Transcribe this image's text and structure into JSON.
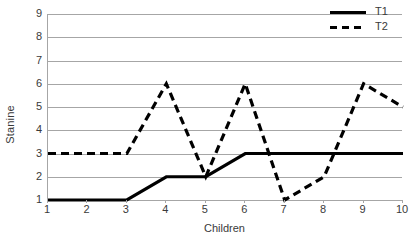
{
  "chart_data": {
    "type": "line",
    "title": "",
    "xlabel": "Children",
    "ylabel": "Stanine",
    "x": [
      1,
      2,
      3,
      4,
      5,
      6,
      7,
      8,
      9,
      10
    ],
    "categories": [
      "1",
      "2",
      "3",
      "4",
      "5",
      "6",
      "7",
      "8",
      "9",
      "10"
    ],
    "xtick_labels": [
      "1",
      "2",
      "3",
      "4",
      "5",
      "6",
      "7",
      "8",
      "9",
      "10"
    ],
    "ytick_labels": [
      "1",
      "2",
      "3",
      "4",
      "5",
      "6",
      "7",
      "8",
      "9"
    ],
    "xlim": [
      1,
      10
    ],
    "ylim": [
      1,
      9
    ],
    "grid": "horizontal",
    "legend_position": "top-right",
    "series": [
      {
        "name": "T1",
        "style": "solid",
        "color": "#000000",
        "values": [
          1,
          1,
          1,
          2,
          2,
          3,
          3,
          3,
          3,
          3
        ]
      },
      {
        "name": "T2",
        "style": "dashed",
        "color": "#000000",
        "values": [
          3,
          3,
          3,
          6,
          2,
          6,
          1,
          2,
          6,
          5
        ]
      }
    ]
  },
  "legend": {
    "entries": [
      {
        "label": "T1",
        "swatch": "solid-line-swatch"
      },
      {
        "label": "T2",
        "swatch": "dashed-line-swatch"
      }
    ]
  },
  "axes": {
    "y_title": "Stanine",
    "x_title": "Children"
  },
  "colors": {
    "series_line": "#000000",
    "gridline": "#a6a6a6",
    "axis": "#a6a6a6",
    "text": "#3a3a3a",
    "background": "#ffffff"
  }
}
